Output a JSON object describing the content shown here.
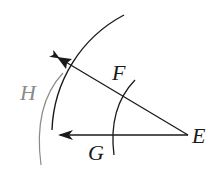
{
  "diagram": {
    "colors": {
      "primary": "#1a1a1a",
      "secondary": "#8a8a8a",
      "background": "#ffffff"
    },
    "labels": {
      "E": "E",
      "F": "F",
      "G": "G",
      "H": "H"
    },
    "points": {
      "E": {
        "x": 188,
        "y": 135
      },
      "upper_arrow_tip": {
        "x": 57,
        "y": 57
      },
      "lower_arrow_tip": {
        "x": 58,
        "y": 135
      }
    },
    "rays": [
      {
        "name": "upper-ray",
        "from": "E",
        "to": "upper_arrow_tip",
        "arrow": true
      },
      {
        "name": "lower-ray",
        "from": "E",
        "to": "lower_arrow_tip",
        "arrow": true
      }
    ],
    "arcs": [
      {
        "name": "large-arc",
        "center": "E",
        "radius": 135,
        "color": "primary"
      },
      {
        "name": "small-arc",
        "center": "E",
        "radius": 75,
        "color": "primary",
        "passes_through": [
          "F",
          "G"
        ]
      },
      {
        "name": "gray-arc",
        "color": "secondary",
        "passes_through": [
          "H"
        ]
      }
    ]
  }
}
